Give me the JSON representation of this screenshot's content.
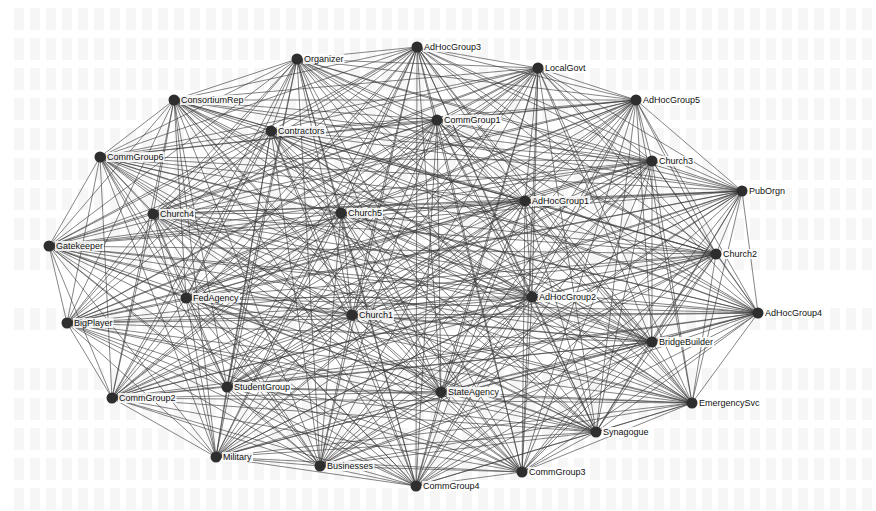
{
  "diagram": {
    "type": "network-graph",
    "node_color": "#2e2e2e",
    "edge_color": "#3a3a3a",
    "nodes": [
      {
        "id": "Organizer",
        "label": "Organizer",
        "x": 297,
        "y": 59
      },
      {
        "id": "AdHocGroup3",
        "label": "AdHocGroup3",
        "x": 417,
        "y": 47
      },
      {
        "id": "LocalGovt",
        "label": "LocalGovt",
        "x": 538,
        "y": 68
      },
      {
        "id": "ConsortiumRep",
        "label": "ConsortiumRep",
        "x": 174,
        "y": 100
      },
      {
        "id": "AdHocGroup5",
        "label": "AdHocGroup5",
        "x": 636,
        "y": 100
      },
      {
        "id": "Contractors",
        "label": "Contractors",
        "x": 271,
        "y": 131
      },
      {
        "id": "CommGroup1",
        "label": "CommGroup1",
        "x": 437,
        "y": 120
      },
      {
        "id": "CommGroup6",
        "label": "CommGroup6",
        "x": 100,
        "y": 157
      },
      {
        "id": "Church3",
        "label": "Church3",
        "x": 652,
        "y": 161
      },
      {
        "id": "PubOrgn",
        "label": "PubOrgn",
        "x": 742,
        "y": 191
      },
      {
        "id": "Church4",
        "label": "Church4",
        "x": 153,
        "y": 214
      },
      {
        "id": "Church5",
        "label": "Church5",
        "x": 341,
        "y": 213
      },
      {
        "id": "AdHocGroup1",
        "label": "AdHocGroup1",
        "x": 525,
        "y": 201
      },
      {
        "id": "Gatekeeper",
        "label": "Gatekeeper",
        "x": 49,
        "y": 246
      },
      {
        "id": "Church2",
        "label": "Church2",
        "x": 716,
        "y": 254
      },
      {
        "id": "FedAgency",
        "label": "FedAgency",
        "x": 186,
        "y": 298
      },
      {
        "id": "AdHocGroup2",
        "label": "AdHocGroup2",
        "x": 532,
        "y": 297
      },
      {
        "id": "Church1",
        "label": "Church1",
        "x": 352,
        "y": 315
      },
      {
        "id": "BigPlayer",
        "label": "BigPlayer",
        "x": 67,
        "y": 323
      },
      {
        "id": "AdHocGroup4",
        "label": "AdHocGroup4",
        "x": 758,
        "y": 313
      },
      {
        "id": "BridgeBuilder",
        "label": "BridgeBuilder",
        "x": 652,
        "y": 342
      },
      {
        "id": "StudentGroup",
        "label": "StudentGroup",
        "x": 227,
        "y": 387
      },
      {
        "id": "CommGroup2",
        "label": "CommGroup2",
        "x": 112,
        "y": 398
      },
      {
        "id": "StateAgency",
        "label": "StateAgency",
        "x": 441,
        "y": 392
      },
      {
        "id": "EmergencySvc",
        "label": "EmergencySvc",
        "x": 692,
        "y": 403
      },
      {
        "id": "Synagogue",
        "label": "Synagogue",
        "x": 596,
        "y": 432
      },
      {
        "id": "Military",
        "label": "Military",
        "x": 216,
        "y": 457
      },
      {
        "id": "Businesses",
        "label": "Businesses",
        "x": 320,
        "y": 466
      },
      {
        "id": "CommGroup3",
        "label": "CommGroup3",
        "x": 522,
        "y": 472
      },
      {
        "id": "CommGroup4",
        "label": "CommGroup4",
        "x": 416,
        "y": 486
      }
    ],
    "edges": "complete"
  }
}
